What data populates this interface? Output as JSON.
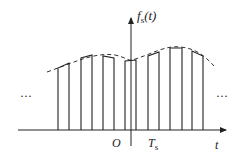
{
  "diagram": {
    "y_axis_label": "f",
    "y_axis_label_sub": "s",
    "y_axis_label_arg": "(t)",
    "x_axis_label": "t",
    "origin_label": "O",
    "period_label": "T",
    "period_label_sub": "s",
    "left_ellipsis": "···",
    "right_ellipsis": "···",
    "colors": {
      "stroke": "#222222",
      "background": "#ffffff"
    },
    "pulses": [
      {
        "x0": 58,
        "x1": 69,
        "y0": 68,
        "y1": 63
      },
      {
        "x0": 81,
        "x1": 92,
        "y0": 58,
        "y1": 55
      },
      {
        "x0": 103,
        "x1": 114,
        "y0": 56,
        "y1": 58
      },
      {
        "x0": 125,
        "x1": 136,
        "y0": 61,
        "y1": 60
      },
      {
        "x0": 148,
        "x1": 159,
        "y0": 56,
        "y1": 52
      },
      {
        "x0": 170,
        "x1": 182,
        "y0": 48,
        "y1": 48
      },
      {
        "x0": 192,
        "x1": 203,
        "y0": 51,
        "y1": 56
      }
    ],
    "baseline_y": 130,
    "envelope": "M47,72 C75,62 95,52 115,55 C125,57 128,61 132,60 C150,55 165,45 180,47 C195,48 205,56 214,66"
  }
}
